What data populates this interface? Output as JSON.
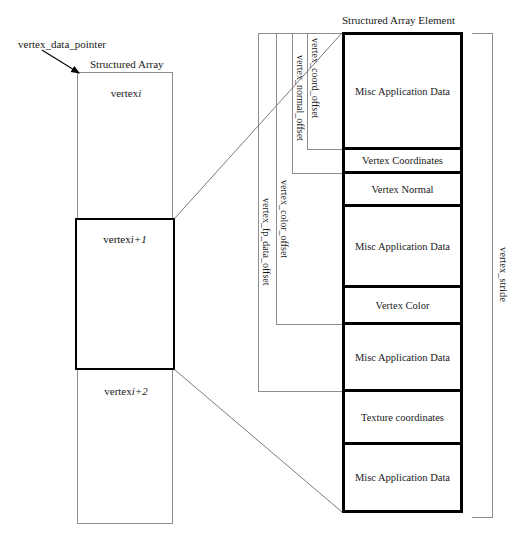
{
  "diagram": {
    "title_left": "Structured Array",
    "title_right": "Structured Array Element",
    "pointer_label": "vertex_data_pointer",
    "stride_label": "vertex_stride"
  },
  "array": {
    "cells": [
      {
        "prefix": "vertex ",
        "index": "i"
      },
      {
        "prefix": "vertex ",
        "index": "i+1"
      },
      {
        "prefix": "vertex ",
        "index": "i+2"
      }
    ]
  },
  "element": {
    "rows": [
      {
        "label": "Misc Application Data"
      },
      {
        "label": "Vertex Coordinates"
      },
      {
        "label": "Vertex Normal"
      },
      {
        "label": "Misc Application Data"
      },
      {
        "label": "Vertex Color"
      },
      {
        "label": "Misc Application Data"
      },
      {
        "label": "Texture coordinates"
      },
      {
        "label": "Misc Application Data"
      }
    ]
  },
  "offsets": [
    {
      "label": "vertex_coord_offset"
    },
    {
      "label": "vertex_normal_offset"
    },
    {
      "label": "vertex_color_offset"
    },
    {
      "label": "vertex_fp_data_offset"
    }
  ]
}
